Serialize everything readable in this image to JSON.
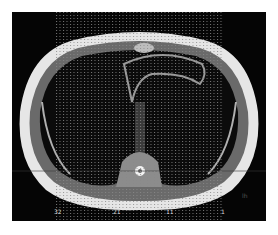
{
  "image": {
    "kind": "axial chest MRI slice with dotted grid overlay",
    "background_color": "#050505",
    "tissue_color": "#e8e8e8"
  },
  "grid": {
    "x_start": 44,
    "x_end": 212,
    "spacing": 3.5,
    "dot_color": "#9a9a9a"
  },
  "scale_labels": [
    {
      "text": "32",
      "x": 42
    },
    {
      "text": "21",
      "x": 101
    },
    {
      "text": "11",
      "x": 154
    },
    {
      "text": "1",
      "x": 209
    }
  ],
  "side_marker": {
    "text": "lh"
  }
}
